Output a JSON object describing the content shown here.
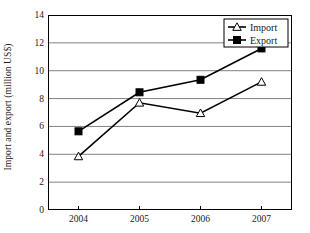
{
  "chart_data": {
    "type": "line",
    "title": "",
    "xlabel": "",
    "ylabel": "Import and export (million US$)",
    "categories": [
      "2004",
      "2005",
      "2006",
      "2007"
    ],
    "series": [
      {
        "name": "Import",
        "marker": "open-triangle",
        "color": "#000000",
        "values": [
          3.85,
          7.7,
          6.95,
          9.2
        ]
      },
      {
        "name": "Export",
        "marker": "filled-square",
        "color": "#000000",
        "values": [
          5.65,
          8.45,
          9.35,
          11.6
        ]
      }
    ],
    "ylim": [
      0,
      14
    ],
    "yticks": [
      0,
      2,
      4,
      6,
      8,
      10,
      12,
      14
    ],
    "ytick_labels": [
      "0",
      "2",
      "4",
      "6",
      "8",
      "10",
      "12",
      "14"
    ],
    "grid": "horizontal",
    "legend_position": "top-right",
    "axis_color": "#000000",
    "grid_color": "#808080"
  },
  "legend": {
    "items": [
      {
        "label": "Import"
      },
      {
        "label": "Export"
      }
    ]
  }
}
